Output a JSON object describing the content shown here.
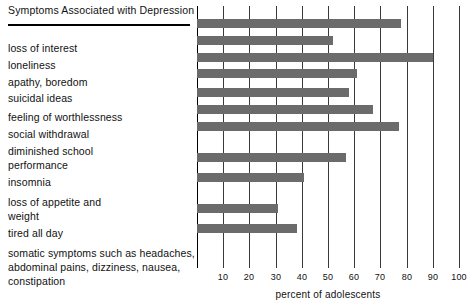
{
  "chart_data": {
    "type": "bar",
    "orientation": "horizontal",
    "title": "Symptoms Associated with Depression",
    "xlabel": "percent of adolescents",
    "ylabel": "",
    "xlim": [
      0,
      100
    ],
    "xticks": [
      0,
      10,
      20,
      30,
      40,
      50,
      60,
      70,
      80,
      90,
      100
    ],
    "xticklabels": [
      "",
      "10",
      "20",
      "30",
      "40",
      "50",
      "60",
      "70",
      "80",
      "90",
      "100"
    ],
    "grid": true,
    "legend": "none",
    "bar_color": "#6b6b6b",
    "categories": [
      "loss of interest",
      "loneliness",
      "apathy, boredom",
      "suicidal ideas",
      "feeling of worthlessness",
      "social withdrawal",
      "diminished school performance",
      "insomnia",
      "loss of appetite and weight",
      "tired all day",
      "somatic symptoms such as headaches, abdominal pains, dizziness, nausea, constipation"
    ],
    "values": [
      78,
      52,
      90,
      61,
      58,
      67,
      77,
      57,
      41,
      31,
      38
    ]
  },
  "label_lines": [
    {
      "text": "loss of interest",
      "top": 14
    },
    {
      "text": "loneliness",
      "top": 31
    },
    {
      "text": "apathy, boredom",
      "top": 48
    },
    {
      "text": "suicidal ideas",
      "top": 64
    },
    {
      "text": "feeling of worthlessness",
      "top": 83
    },
    {
      "text": "social withdrawal",
      "top": 100
    },
    {
      "text": "diminished school",
      "top": 117
    },
    {
      "text": "performance",
      "top": 131
    },
    {
      "text": "insomnia",
      "top": 148
    },
    {
      "text": "loss of appetite and",
      "top": 168
    },
    {
      "text": "weight",
      "top": 182
    },
    {
      "text": "tired all day",
      "top": 199
    },
    {
      "text": "somatic symptoms such as headaches,",
      "top": 219
    },
    {
      "text": "abdominal pains, dizziness, nausea,",
      "top": 233
    },
    {
      "text": "constipation",
      "top": 247
    }
  ],
  "bar_rows": [
    {
      "name": "loss-of-interest",
      "value": 78,
      "top": 13
    },
    {
      "name": "loneliness",
      "value": 52,
      "top": 30
    },
    {
      "name": "apathy-boredom",
      "value": 90,
      "top": 47
    },
    {
      "name": "suicidal-ideas",
      "value": 61,
      "top": 63
    },
    {
      "name": "feeling-of-worthlessness",
      "value": 58,
      "top": 82
    },
    {
      "name": "social-withdrawal",
      "value": 67,
      "top": 99
    },
    {
      "name": "diminished-school-performance",
      "value": 77,
      "top": 116
    },
    {
      "name": "insomnia",
      "value": 57,
      "top": 147
    },
    {
      "name": "loss-of-appetite-and-weight",
      "value": 41,
      "top": 167
    },
    {
      "name": "tired-all-day",
      "value": 31,
      "top": 198
    },
    {
      "name": "somatic-symptoms",
      "value": 38,
      "top": 218
    }
  ]
}
